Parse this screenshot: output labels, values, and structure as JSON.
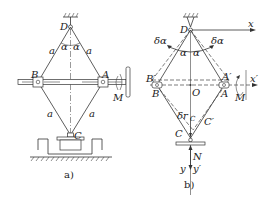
{
  "figure": {
    "subfigures": [
      {
        "id": "a",
        "caption": "a)",
        "points": {
          "D": "D",
          "B": "B",
          "A": "A",
          "C": "C"
        },
        "link_labels": [
          "a",
          "a",
          "a",
          "a"
        ],
        "angle_labels": [
          "α",
          "α"
        ],
        "moment_label": "M"
      },
      {
        "id": "b",
        "caption": "b)",
        "points": {
          "D": "D",
          "B": "B",
          "Bp": "B′",
          "A": "A",
          "Ap": "A′",
          "O": "O",
          "C": "C",
          "Cp": "C′"
        },
        "angle_labels": [
          "α",
          "α"
        ],
        "virtual_angle_labels": [
          "δα",
          "δα"
        ],
        "axis_labels": {
          "x": "x",
          "xp": "x′",
          "y": "y",
          "yp": "y′"
        },
        "displacement_label": "δr",
        "displacement_sub": "C",
        "force_label": "N",
        "moment_label": "M"
      }
    ]
  }
}
